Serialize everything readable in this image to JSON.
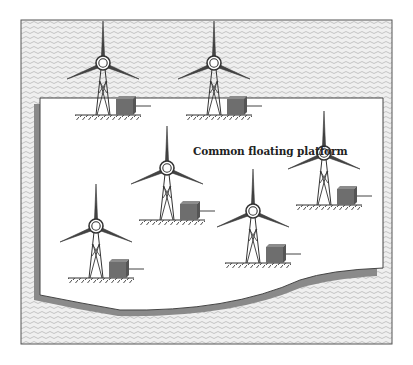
{
  "diagram": {
    "label": "Common floating platform",
    "label_position": {
      "x": 193,
      "y": 146
    },
    "colors": {
      "sea_fill": "#ececec",
      "sea_wave": "#bdbdbd",
      "frame_stroke": "#555555",
      "platform_fill": "#ffffff",
      "platform_shadow": "#8a8a8a",
      "turbine_stroke": "#333333",
      "box_fill": "#6e6e6e",
      "box_top": "#8c8c8c",
      "box_side": "#555555"
    },
    "frame": {
      "x": 21,
      "y": 20,
      "width": 371,
      "height": 324
    },
    "platform": {
      "top": 98,
      "left": 40,
      "right": 383,
      "bottom_curve": "M40,295 Q80,303 120,310 Q230,312 300,280 Q330,270 383,268"
    },
    "turbines": [
      {
        "id": "turbine-1",
        "hub_x": 103,
        "hub_y": 63,
        "on_platform": false
      },
      {
        "id": "turbine-2",
        "hub_x": 214,
        "hub_y": 63,
        "on_platform": false
      },
      {
        "id": "turbine-3",
        "hub_x": 167,
        "hub_y": 168,
        "on_platform": true
      },
      {
        "id": "turbine-4",
        "hub_x": 324,
        "hub_y": 153,
        "on_platform": true
      },
      {
        "id": "turbine-5",
        "hub_x": 96,
        "hub_y": 226,
        "on_platform": true
      },
      {
        "id": "turbine-6",
        "hub_x": 253,
        "hub_y": 211,
        "on_platform": true
      }
    ]
  }
}
